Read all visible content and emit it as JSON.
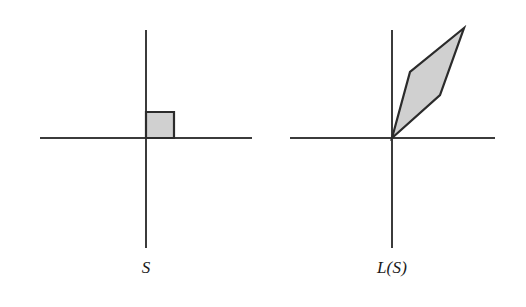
{
  "figure": {
    "background_color": "#ffffff",
    "axis_color": "#3b3b3b",
    "shape_stroke_color": "#2b2b2b",
    "shape_fill_color": "#d0d0d0",
    "panels": [
      {
        "id": "panel-s",
        "caption": "S",
        "origin": {
          "x": 146,
          "y": 138
        },
        "x_axis": {
          "x1": 40,
          "y1": 138,
          "x2": 252,
          "y2": 138
        },
        "y_axis": {
          "x1": 146,
          "y1": 30,
          "x2": 146,
          "y2": 248
        },
        "shape": {
          "name": "unit-square",
          "type": "polygon",
          "points": "146,138 146,112 174,112 174,138"
        }
      },
      {
        "id": "panel-ls",
        "caption": "L(S)",
        "origin": {
          "x": 392,
          "y": 138
        },
        "x_axis": {
          "x1": 290,
          "y1": 138,
          "x2": 495,
          "y2": 138
        },
        "y_axis": {
          "x1": 392,
          "y1": 30,
          "x2": 392,
          "y2": 248
        },
        "shape": {
          "name": "transformed-parallelogram",
          "type": "polygon",
          "points": "392,138 410,72 464,28 440,95"
        }
      }
    ]
  },
  "chart_data": {
    "type": "diagram",
    "title": "",
    "panels": [
      {
        "label": "S",
        "region_vertices_pixel": [
          [
            146,
            138
          ],
          [
            146,
            112
          ],
          [
            174,
            112
          ],
          [
            174,
            138
          ]
        ],
        "region_vertices_math": [
          [
            0,
            0
          ],
          [
            0,
            1
          ],
          [
            1,
            1
          ],
          [
            1,
            0
          ]
        ],
        "axes": {
          "x_range_pixel": [
            40,
            252
          ],
          "y_range_pixel": [
            30,
            248
          ]
        }
      },
      {
        "label": "L(S)",
        "region_vertices_pixel": [
          [
            392,
            138
          ],
          [
            410,
            72
          ],
          [
            464,
            28
          ],
          [
            440,
            95
          ]
        ],
        "region_vertices_math": [
          [
            0,
            0
          ],
          [
            0.65,
            2.4
          ],
          [
            2.6,
            4.0
          ],
          [
            1.75,
            1.55
          ]
        ],
        "axes": {
          "x_range_pixel": [
            290,
            495
          ],
          "y_range_pixel": [
            30,
            248
          ]
        }
      }
    ]
  }
}
